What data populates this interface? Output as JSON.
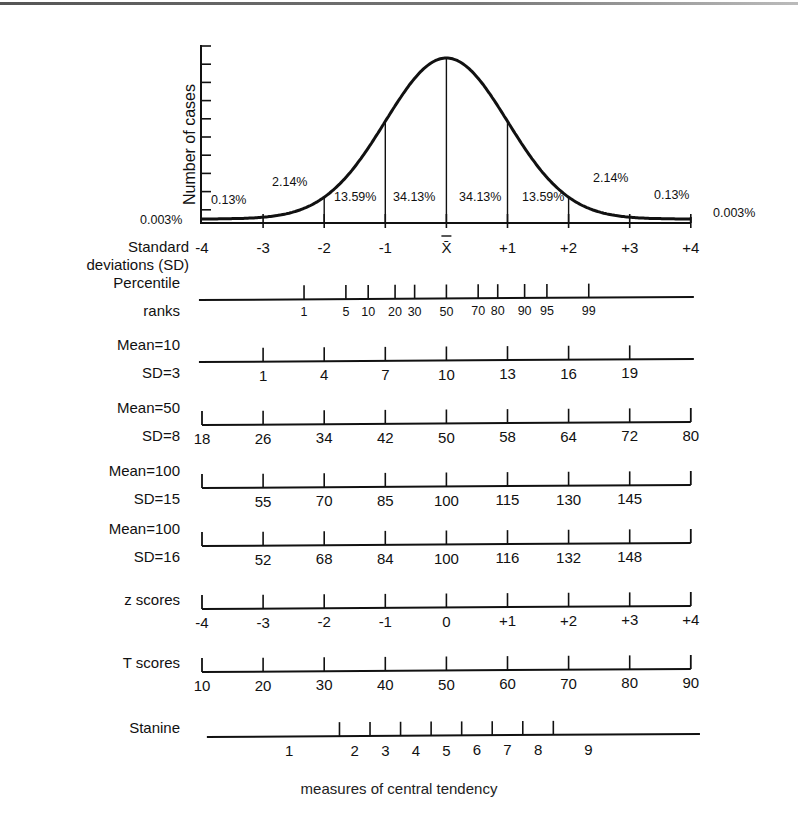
{
  "caption": "measures of central tendency",
  "colors": {
    "ink": "#111111",
    "background": "#ffffff"
  },
  "chart_data": {
    "type": "line",
    "title": "",
    "subtitle": "",
    "xlabel": "Standard deviations (SD)",
    "ylabel": "Number of cases",
    "grid": false,
    "legend": "none",
    "xlim": [
      -4,
      4
    ],
    "x_ticks": [
      "-4",
      "-3",
      "-2",
      "-1",
      "X̄",
      "+1",
      "+2",
      "+3",
      "+4"
    ],
    "curve": "normal distribution (bell curve), mean 0, SD 1",
    "y_ticks_count": 10,
    "area_percentages": [
      {
        "range": "below -4",
        "label": "0.003%"
      },
      {
        "range": "-4 to -3",
        "label": "0.13%"
      },
      {
        "range": "-3 to -2",
        "label": "2.14%"
      },
      {
        "range": "-2 to -1",
        "label": "13.59%"
      },
      {
        "range": "-1 to 0",
        "label": "34.13%"
      },
      {
        "range": "0 to +1",
        "label": "34.13%"
      },
      {
        "range": "+1 to +2",
        "label": "13.59%"
      },
      {
        "range": "+2 to +3",
        "label": "2.14%"
      },
      {
        "range": "+3 to +4",
        "label": "0.13%"
      },
      {
        "range": "above +4",
        "label": "0.003%"
      }
    ],
    "scales": [
      {
        "name": "Percentile ranks",
        "label_lines": [
          "Percentile",
          "ranks"
        ],
        "values": [
          "1",
          "5",
          "10",
          "20",
          "30",
          "50",
          "70",
          "80",
          "90",
          "95",
          "99"
        ],
        "sd_positions": [
          -2.33,
          -1.645,
          -1.28,
          -0.84,
          -0.52,
          0,
          0.52,
          0.84,
          1.28,
          1.645,
          2.33
        ]
      },
      {
        "name": "Mean=10 SD=3",
        "label_lines": [
          "Mean=10",
          "SD=3"
        ],
        "values": [
          "1",
          "4",
          "7",
          "10",
          "13",
          "16",
          "19"
        ],
        "sd_positions": [
          -3,
          -2,
          -1,
          0,
          1,
          2,
          3
        ]
      },
      {
        "name": "Mean=50 SD=8",
        "label_lines": [
          "Mean=50",
          "SD=8"
        ],
        "values": [
          "18",
          "26",
          "34",
          "42",
          "50",
          "58",
          "64",
          "72",
          "80"
        ],
        "sd_positions": [
          -4,
          -3,
          -2,
          -1,
          0,
          1,
          2,
          3,
          4
        ]
      },
      {
        "name": "Mean=100 SD=15",
        "label_lines": [
          "Mean=100",
          "SD=15"
        ],
        "values": [
          "55",
          "70",
          "85",
          "100",
          "115",
          "130",
          "145"
        ],
        "sd_positions": [
          -3,
          -2,
          -1,
          0,
          1,
          2,
          3
        ]
      },
      {
        "name": "Mean=100 SD=16",
        "label_lines": [
          "Mean=100",
          "SD=16"
        ],
        "values": [
          "52",
          "68",
          "84",
          "100",
          "116",
          "132",
          "148"
        ],
        "sd_positions": [
          -3,
          -2,
          -1,
          0,
          1,
          2,
          3
        ]
      },
      {
        "name": "z scores",
        "label_lines": [
          "z scores"
        ],
        "values": [
          "-4",
          "-3",
          "-2",
          "-1",
          "0",
          "+1",
          "+2",
          "+3",
          "+4"
        ],
        "sd_positions": [
          -4,
          -3,
          -2,
          -1,
          0,
          1,
          2,
          3,
          4
        ]
      },
      {
        "name": "T scores",
        "label_lines": [
          "T scores"
        ],
        "values": [
          "10",
          "20",
          "30",
          "40",
          "50",
          "60",
          "70",
          "80",
          "90"
        ],
        "sd_positions": [
          -4,
          -3,
          -2,
          -1,
          0,
          1,
          2,
          3,
          4
        ]
      },
      {
        "name": "Stanine",
        "label_lines": [
          "Stanine"
        ],
        "values": [
          "1",
          "2",
          "3",
          "4",
          "5",
          "6",
          "7",
          "8",
          "9"
        ],
        "boundaries_sd": [
          -1.75,
          -1.25,
          -0.75,
          -0.25,
          0.25,
          0.75,
          1.25,
          1.75
        ]
      }
    ]
  }
}
